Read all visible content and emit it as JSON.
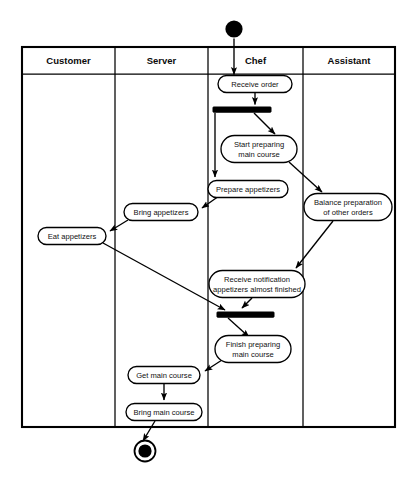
{
  "diagram": {
    "type": "uml-activity-swimlane",
    "background_color": "#ffffff",
    "line_color": "#000000",
    "node_fill_color": "#ffffff",
    "frame": {
      "x": 22,
      "y": 47,
      "width": 373,
      "height": 380
    },
    "lanes": [
      {
        "id": "customer",
        "label": "Customer",
        "x": 22,
        "width": 93,
        "center_x": 68.5
      },
      {
        "id": "server",
        "label": "Server",
        "x": 115,
        "width": 93,
        "center_x": 161.5
      },
      {
        "id": "chef",
        "label": "Chef",
        "x": 208,
        "width": 95,
        "center_x": 255.5
      },
      {
        "id": "assistant",
        "label": "Assistant",
        "x": 303,
        "width": 92,
        "center_x": 349
      }
    ],
    "lane_header_y": 60,
    "lane_header_rule_y": 74,
    "control_nodes": [
      {
        "id": "start",
        "kind": "initial-node",
        "label": "",
        "cx": 234,
        "cy": 29,
        "r": 8.6
      },
      {
        "id": "fork",
        "kind": "fork-bar",
        "label": "",
        "x": 213,
        "y": 107,
        "width": 58,
        "height": 5.2
      },
      {
        "id": "join",
        "kind": "join-bar",
        "label": "",
        "x": 217,
        "y": 312,
        "width": 57,
        "height": 5.2
      },
      {
        "id": "end",
        "kind": "final-node",
        "label": "",
        "cx": 145,
        "cy": 451,
        "r_outer": 10.5,
        "r_inner": 6.6
      }
    ],
    "activities": [
      {
        "id": "receive-order",
        "lane": "chef",
        "lines": [
          "Receive order"
        ],
        "cx": 255,
        "cy": 84,
        "width": 74,
        "height": 17
      },
      {
        "id": "start-preparing",
        "lane": "chef",
        "lines": [
          "Start preparing",
          "main course"
        ],
        "cx": 259,
        "cy": 149,
        "width": 76,
        "height": 27
      },
      {
        "id": "prepare-appetizers",
        "lane": "chef",
        "lines": [
          "Prepare appetizers"
        ],
        "cx": 248,
        "cy": 189,
        "width": 80,
        "height": 17
      },
      {
        "id": "balance-preparation",
        "lane": "assistant",
        "lines": [
          "Balance preparation",
          "of other orders"
        ],
        "cx": 348,
        "cy": 207,
        "width": 88,
        "height": 27
      },
      {
        "id": "bring-appetizers",
        "lane": "server",
        "lines": [
          "Bring appetizers"
        ],
        "cx": 161,
        "cy": 212,
        "width": 74,
        "height": 17
      },
      {
        "id": "eat-appetizers",
        "lane": "customer",
        "lines": [
          "Eat appetizers"
        ],
        "cx": 72,
        "cy": 236,
        "width": 68,
        "height": 17
      },
      {
        "id": "receive-notification",
        "lane": "chef",
        "lines": [
          "Receive notification",
          "appetizers almost finished"
        ],
        "cx": 257,
        "cy": 284,
        "width": 96,
        "height": 27
      },
      {
        "id": "finish-preparing",
        "lane": "chef",
        "lines": [
          "Finish preparing",
          "main course"
        ],
        "cx": 253,
        "cy": 349,
        "width": 76,
        "height": 27
      },
      {
        "id": "get-main-course",
        "lane": "server",
        "lines": [
          "Get main course"
        ],
        "cx": 164,
        "cy": 375,
        "width": 72,
        "height": 17
      },
      {
        "id": "bring-main-course",
        "lane": "server",
        "lines": [
          "Bring main course"
        ],
        "cx": 164,
        "cy": 412,
        "width": 76,
        "height": 17
      }
    ],
    "flows": [
      {
        "id": "start-to-receive-order",
        "from": "start",
        "to": "receive-order",
        "label": ""
      },
      {
        "id": "receive-order-to-fork",
        "from": "receive-order",
        "to": "fork",
        "label": ""
      },
      {
        "id": "fork-to-start-preparing",
        "from": "fork",
        "to": "start-preparing",
        "label": ""
      },
      {
        "id": "fork-to-prepare-appetizers",
        "from": "fork",
        "to": "prepare-appetizers",
        "label": ""
      },
      {
        "id": "start-preparing-to-balance",
        "from": "start-preparing",
        "to": "balance-preparation",
        "label": ""
      },
      {
        "id": "prepare-appetizers-to-bring-appetizers",
        "from": "prepare-appetizers",
        "to": "bring-appetizers",
        "label": ""
      },
      {
        "id": "bring-appetizers-to-eat-appetizers",
        "from": "bring-appetizers",
        "to": "eat-appetizers",
        "label": ""
      },
      {
        "id": "balance-to-receive-notification",
        "from": "balance-preparation",
        "to": "receive-notification",
        "label": ""
      },
      {
        "id": "receive-notification-to-join",
        "from": "receive-notification",
        "to": "join",
        "label": ""
      },
      {
        "id": "eat-appetizers-to-join",
        "from": "eat-appetizers",
        "to": "join",
        "label": ""
      },
      {
        "id": "join-to-finish-preparing",
        "from": "join",
        "to": "finish-preparing",
        "label": ""
      },
      {
        "id": "finish-preparing-to-get-main-course",
        "from": "finish-preparing",
        "to": "get-main-course",
        "label": ""
      },
      {
        "id": "get-main-course-to-bring-main-course",
        "from": "get-main-course",
        "to": "bring-main-course",
        "label": ""
      },
      {
        "id": "bring-main-course-to-end",
        "from": "bring-main-course",
        "to": "end",
        "label": ""
      }
    ]
  }
}
